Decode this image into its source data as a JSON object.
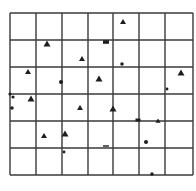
{
  "diagram": {
    "type": "grid-scatter",
    "background": "#ffffff",
    "line_color": "#3a3a3a",
    "mark_color": "#1e1e1e",
    "grid": {
      "columns": 7,
      "rows": 6,
      "x_lines": [
        10,
        36,
        62,
        88,
        113,
        139,
        165,
        193
      ],
      "y_lines": [
        13,
        40,
        67,
        94,
        121,
        148,
        175
      ]
    },
    "marks": [
      {
        "x": 123,
        "y": 22,
        "shape": "triangle",
        "size": 3
      },
      {
        "x": 47,
        "y": 44,
        "shape": "triangle",
        "size": 3.5
      },
      {
        "x": 106,
        "y": 42,
        "shape": "rect",
        "size": 3
      },
      {
        "x": 82,
        "y": 59,
        "shape": "triangle",
        "size": 3
      },
      {
        "x": 28,
        "y": 72,
        "shape": "triangle",
        "size": 3
      },
      {
        "x": 122,
        "y": 64,
        "shape": "dot",
        "size": 2.2
      },
      {
        "x": 61,
        "y": 82,
        "shape": "dot",
        "size": 2.5
      },
      {
        "x": 99,
        "y": 79,
        "shape": "triangle",
        "size": 3.5
      },
      {
        "x": 181,
        "y": 73,
        "shape": "triangle",
        "size": 3.5
      },
      {
        "x": 167,
        "y": 89,
        "shape": "dot",
        "size": 1.8
      },
      {
        "x": 10,
        "y": 94,
        "shape": "dot",
        "size": 2
      },
      {
        "x": 13,
        "y": 97,
        "shape": "dot",
        "size": 2
      },
      {
        "x": 31,
        "y": 99,
        "shape": "triangle",
        "size": 3.5
      },
      {
        "x": 12,
        "y": 108,
        "shape": "dot",
        "size": 2.2
      },
      {
        "x": 80,
        "y": 108,
        "shape": "triangle",
        "size": 3
      },
      {
        "x": 113,
        "y": 109,
        "shape": "triangle",
        "size": 3.5
      },
      {
        "x": 138,
        "y": 120,
        "shape": "rect",
        "size": 2.5
      },
      {
        "x": 158,
        "y": 121,
        "shape": "triangle",
        "size": 2.5
      },
      {
        "x": 44,
        "y": 136,
        "shape": "triangle",
        "size": 3
      },
      {
        "x": 65,
        "y": 134,
        "shape": "triangle",
        "size": 3.5
      },
      {
        "x": 64,
        "y": 152,
        "shape": "dot",
        "size": 1.8
      },
      {
        "x": 106,
        "y": 146,
        "shape": "dash",
        "size": 3
      },
      {
        "x": 146,
        "y": 142,
        "shape": "dot",
        "size": 2.5
      },
      {
        "x": 152,
        "y": 174,
        "shape": "dot",
        "size": 2.2
      }
    ]
  }
}
